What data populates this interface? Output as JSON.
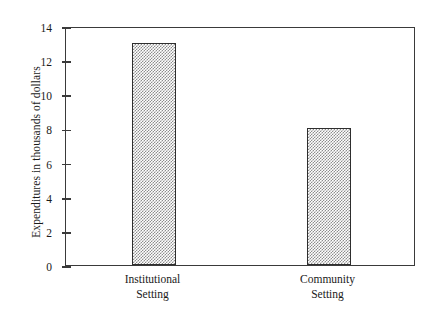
{
  "chart_data": {
    "type": "bar",
    "title": "",
    "xlabel": "",
    "ylabel": "Expenditures in thousands of dollars",
    "categories": [
      "Institutional Setting",
      "Community Setting"
    ],
    "category_lines": [
      [
        "Institutional",
        "Setting"
      ],
      [
        "Community",
        "Setting"
      ]
    ],
    "values": [
      13,
      8
    ],
    "ylim": [
      0,
      14
    ],
    "ytick_step": 2,
    "yticks": [
      0,
      2,
      4,
      6,
      8,
      10,
      12,
      14
    ],
    "ytick_labels": [
      "0",
      "2",
      "4",
      "6",
      "8",
      "10",
      "12",
      "14"
    ],
    "grid": false,
    "legend": "none",
    "bar_fill": "checkerboard-gray",
    "bar_fill_color": "#8d8d8d",
    "bar_border_color": "#2e2e2e",
    "frame_color": "#3a3a3a"
  },
  "axis": {
    "y_title": "Expenditures in thousands of dollars"
  },
  "caption": {
    "clipped_top_text": ""
  }
}
